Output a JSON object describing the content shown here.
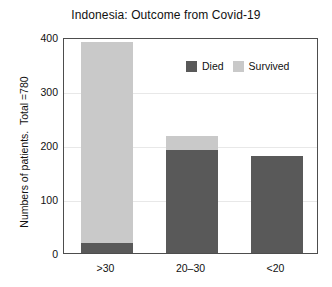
{
  "chart_data": {
    "type": "bar",
    "subtype": "stacked",
    "title": "Indonesia: Outcome from Covid-19",
    "xlabel": "",
    "ylabel": "Numbers of patients.  Total =780",
    "categories": [
      ">30",
      "20–30",
      "<20"
    ],
    "series": [
      {
        "name": "Died",
        "values": [
          18,
          190,
          180
        ],
        "color": "#595959"
      },
      {
        "name": "Survived",
        "values": [
          372,
          27,
          0
        ],
        "color": "#c9c9c9"
      }
    ],
    "ylim": [
      0,
      400
    ],
    "yticks": [
      0,
      100,
      200,
      300,
      400
    ],
    "ytick_labels": [
      "0",
      "100",
      "200",
      "300",
      "400"
    ],
    "grid": true,
    "grid_axis": "y",
    "legend_position": "upper right inside",
    "bar_totals": [
      390,
      217,
      180
    ],
    "annotations": []
  },
  "legend": {
    "entries": [
      {
        "label": "Died",
        "color": "#595959"
      },
      {
        "label": "Survived",
        "color": "#c9c9c9"
      }
    ]
  },
  "axes": {
    "frame_color": "#4d4d4d",
    "grid_color": "#e8e8e8"
  }
}
